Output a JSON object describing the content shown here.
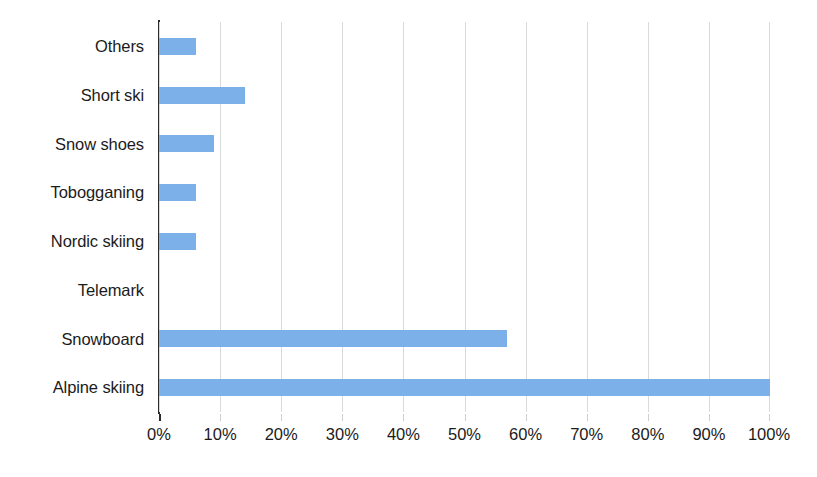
{
  "chart_data": {
    "type": "bar",
    "orientation": "horizontal",
    "title": "",
    "subtitle": "",
    "xlabel": "",
    "ylabel": "",
    "categories": [
      "Others",
      "Short ski",
      "Snow shoes",
      "Tobogganing",
      "Nordic skiing",
      "Telemark",
      "Snowboard",
      "Alpine skiing"
    ],
    "values": [
      6,
      14,
      9,
      6,
      6,
      0,
      57,
      100
    ],
    "value_suffix": "%",
    "xlim": [
      0,
      100
    ],
    "xticks": [
      0,
      10,
      20,
      30,
      40,
      50,
      60,
      70,
      80,
      90,
      100
    ],
    "xtick_labels": [
      "0%",
      "10%",
      "20%",
      "30%",
      "40%",
      "50%",
      "60%",
      "70%",
      "80%",
      "90%",
      "100%"
    ],
    "grid": {
      "vertical": true,
      "horizontal": false,
      "color": "#d9d9d9"
    },
    "legend": {
      "visible": false,
      "position": "none"
    },
    "series": [
      {
        "name": "Share of participants",
        "color": "#7cb0e8",
        "values": [
          6,
          14,
          9,
          6,
          6,
          0,
          57,
          100
        ]
      }
    ],
    "colors": {
      "bar": "#7cb0e8",
      "axis_line": "#2b2b2b",
      "gridline": "#d9d9d9",
      "text": "#1b1b1b",
      "background": "#ffffff"
    }
  }
}
